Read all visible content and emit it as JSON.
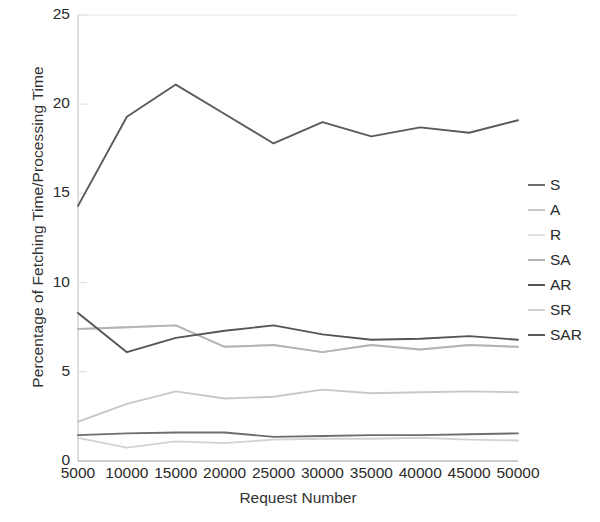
{
  "chart_data": {
    "type": "line",
    "title": "",
    "xlabel": "Request Number",
    "ylabel": "Percentage of Fetching Time/Processing Time",
    "x": [
      5000,
      10000,
      15000,
      20000,
      25000,
      30000,
      35000,
      40000,
      45000,
      50000
    ],
    "xticklabels": [
      "5000",
      "10000",
      "15000",
      "20000",
      "25000",
      "30000",
      "35000",
      "40000",
      "45000",
      "50000"
    ],
    "yticklabels": [
      "0",
      "5",
      "10",
      "15",
      "20",
      "25"
    ],
    "yticks": [
      0,
      5,
      10,
      15,
      20,
      25
    ],
    "xlim": [
      5000,
      50000
    ],
    "ylim": [
      0,
      25
    ],
    "grid": false,
    "legend_position": "right",
    "series": [
      {
        "name": "S",
        "color": "#6e6e6e",
        "values": [
          1.45,
          1.55,
          1.6,
          1.6,
          1.35,
          1.4,
          1.45,
          1.45,
          1.5,
          1.55
        ]
      },
      {
        "name": "A",
        "color": "#c8c8c8",
        "values": [
          2.2,
          3.2,
          3.9,
          3.5,
          3.6,
          4.0,
          3.8,
          3.85,
          3.9,
          3.85
        ]
      },
      {
        "name": "R",
        "color": "#dedede",
        "values": [
          7.4,
          7.5,
          7.6,
          6.4,
          6.5,
          6.1,
          6.5,
          6.25,
          6.5,
          6.4
        ]
      },
      {
        "name": "SA",
        "color": "#b4b4b4",
        "values": [
          7.4,
          7.5,
          7.6,
          6.4,
          6.5,
          6.1,
          6.5,
          6.25,
          6.5,
          6.4
        ]
      },
      {
        "name": "AR",
        "color": "#555555",
        "values": [
          8.3,
          6.1,
          6.9,
          7.3,
          7.6,
          7.1,
          6.8,
          6.85,
          7.0,
          6.8
        ]
      },
      {
        "name": "SR",
        "color": "#d2d2d2",
        "values": [
          1.3,
          0.75,
          1.1,
          1.0,
          1.2,
          1.25,
          1.25,
          1.3,
          1.2,
          1.15
        ]
      },
      {
        "name": "SAR",
        "color": "#5a5a5a",
        "values": [
          14.3,
          19.3,
          21.1,
          19.45,
          17.8,
          19.0,
          18.2,
          18.7,
          18.4,
          19.1
        ]
      }
    ],
    "legend_entries": [
      {
        "label": "S",
        "color": "#6e6e6e"
      },
      {
        "label": "A",
        "color": "#c8c8c8"
      },
      {
        "label": "R",
        "color": "#e2e2e2"
      },
      {
        "label": "SA",
        "color": "#b4b4b4"
      },
      {
        "label": "AR",
        "color": "#555555"
      },
      {
        "label": "SR",
        "color": "#d2d2d2"
      },
      {
        "label": "SAR",
        "color": "#5a5a5a"
      }
    ]
  }
}
